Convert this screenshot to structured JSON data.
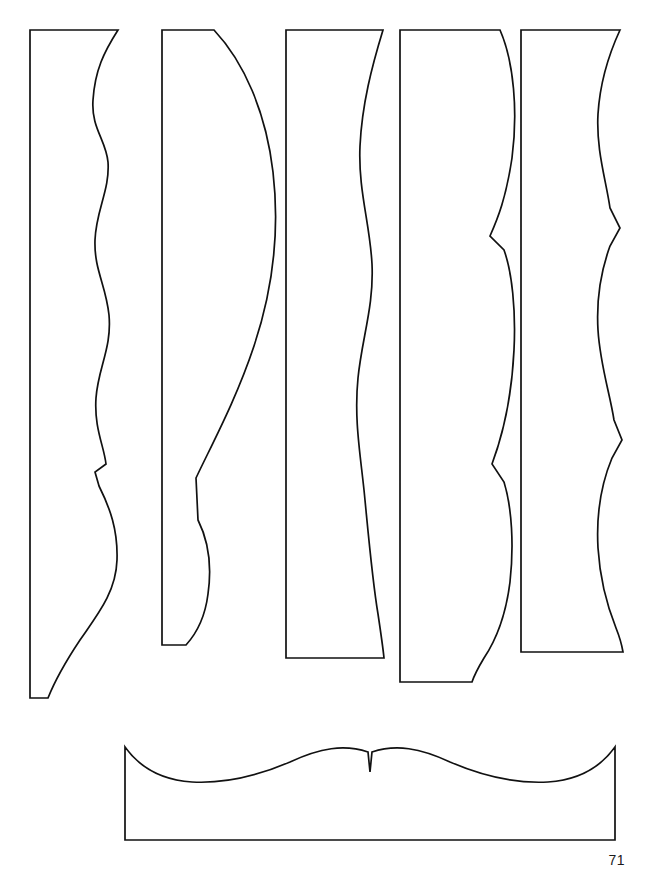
{
  "document": {
    "page_number": "71",
    "background_color": "#ffffff",
    "stroke_color": "#111111",
    "width": 651,
    "height": 879
  },
  "figure": {
    "pieces": [
      {
        "id": "piece-1",
        "label": "vertical-strip-1",
        "kind": "vertical",
        "notes": "Straight left edge, S-wave right edge with a cusp, flat top, flat bottom widening to the right.",
        "path": "M 30 30 L 118 30 C 104 52 95 70 93 100 C 91 128 106 140 108 162 C 110 190 96 210 95 240 C 94 270 106 285 109 315 C 112 348 98 368 96 398 C 94 428 104 446 106 464 L 95 472 L 99 486 C 110 508 118 530 117 560 C 116 592 98 614 80 640 C 68 658 56 678 48 698 L 30 698 Z"
      },
      {
        "id": "piece-2",
        "label": "vertical-strip-2",
        "kind": "vertical",
        "notes": "Narrow strip with a strong convex bulge on the right; lower right edge runs diagonally back with a small cusp and concave return.",
        "path": "M 162 30 L 214 30 C 244 62 266 112 273 172 C 280 232 272 292 254 346 C 236 400 212 444 196 478 L 198 520 C 208 540 212 566 208 594 C 205 618 196 634 186 645 L 162 645 Z"
      },
      {
        "id": "piece-3",
        "label": "vertical-strip-3",
        "kind": "vertical",
        "notes": "Wide strip with a gentle long S-curve down the right edge; slightly tapered bottom.",
        "path": "M 286 30 L 383 30 C 372 66 362 104 360 146 C 358 190 370 224 372 264 C 374 306 362 338 358 378 C 354 418 360 452 364 490 C 368 530 372 578 378 614 C 381 634 383 648 384 658 L 286 658 Z"
      },
      {
        "id": "piece-4",
        "label": "vertical-strip-4",
        "kind": "vertical",
        "notes": "Straight left edge with three large scallops and two sharp inward cusps on the right edge.",
        "path": "M 400 30 L 500 30 C 514 62 518 112 512 158 C 506 198 498 218 490 236 L 504 250 C 512 272 516 310 514 350 C 512 392 504 432 492 464 L 504 482 C 512 508 514 546 510 582 C 506 614 496 640 484 658 C 478 668 474 676 472 682 L 400 682 Z"
      },
      {
        "id": "piece-5",
        "label": "vertical-strip-5",
        "kind": "vertical",
        "notes": "Straight left edge; right edge waves outward then inward with a sharp cusp near mid-height, ending with a widening flare at the bottom.",
        "path": "M 521 30 L 620 30 C 608 56 600 82 598 114 C 596 150 606 180 610 208 L 620 228 L 610 246 C 602 268 596 296 598 330 C 600 364 610 394 614 420 L 622 440 L 612 458 C 602 482 596 512 598 548 C 600 580 608 608 616 628 C 620 638 622 646 623 652 L 521 652 Z"
      },
      {
        "id": "piece-6",
        "label": "horizontal-strip-bottom",
        "kind": "horizontal",
        "notes": "Wide low rectangle with a symmetric scalloped top edge: two broad humps meeting at a central V-shaped cusp.",
        "path": "M 125 747 L 125 840 L 615 840 L 615 747 C 600 768 578 780 548 782 C 512 784 478 774 450 762 C 420 748 396 744 372 752 L 370 772 L 368 752 C 344 744 320 748 290 762 C 262 774 228 784 192 782 C 162 780 140 768 125 747 Z"
      }
    ]
  }
}
